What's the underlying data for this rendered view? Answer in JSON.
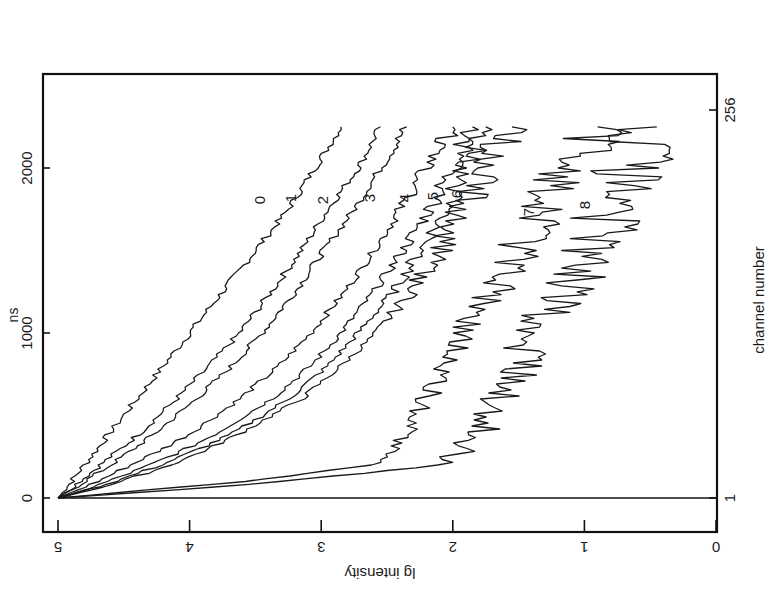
{
  "figure": {
    "orientation": "rotated 90 degrees clockwise (time axis vertical, intensity axis horizontal)",
    "x_axis_label": "lg intensity",
    "y_axis_left_label": "ns",
    "y_axis_right_label": "channel number",
    "x_ticks": [
      "5",
      "4",
      "3",
      "2",
      "1",
      "0"
    ],
    "y_left_ticks": [
      "0",
      "1000",
      "2000"
    ],
    "y_right_ticks": [
      "1",
      "256"
    ],
    "curve_labels": [
      "0",
      "1",
      "2",
      "3",
      "4",
      "5",
      "6",
      "7",
      "8"
    ]
  },
  "chart_data": {
    "type": "line",
    "title": "",
    "xlabel": "ns (channel number 1–256)",
    "ylabel": "lg Intensity",
    "xlim": [
      0,
      2250
    ],
    "ylim": [
      0,
      5
    ],
    "x_ticks": [
      0,
      1000,
      2000
    ],
    "y_ticks": [
      0,
      1,
      2,
      3,
      4,
      5
    ],
    "channel_ticks": [
      1,
      256
    ],
    "grid": false,
    "legend": "inline curve labels 0–8",
    "x": [
      0,
      50,
      100,
      200,
      300,
      400,
      600,
      800,
      1000,
      1250,
      1500,
      1750,
      2000,
      2250
    ],
    "series": [
      {
        "name": "0",
        "values": [
          5.0,
          4.95,
          4.9,
          4.8,
          4.7,
          4.6,
          4.4,
          4.2,
          4.0,
          3.75,
          3.5,
          3.25,
          3.05,
          2.85
        ]
      },
      {
        "name": "1",
        "values": [
          5.0,
          4.92,
          4.84,
          4.68,
          4.52,
          4.37,
          4.1,
          3.85,
          3.62,
          3.38,
          3.15,
          2.95,
          2.72,
          2.55
        ]
      },
      {
        "name": "2",
        "values": [
          5.0,
          4.9,
          4.8,
          4.6,
          4.42,
          4.25,
          3.95,
          3.68,
          3.45,
          3.2,
          2.98,
          2.75,
          2.55,
          2.35
        ]
      },
      {
        "name": "3",
        "values": [
          5.0,
          4.85,
          4.7,
          4.45,
          4.2,
          3.98,
          3.62,
          3.32,
          3.08,
          2.82,
          2.6,
          2.4,
          2.2,
          2.0
        ]
      },
      {
        "name": "4",
        "values": [
          5.0,
          4.8,
          4.62,
          4.3,
          4.02,
          3.78,
          3.38,
          3.08,
          2.85,
          2.6,
          2.38,
          2.18,
          2.0,
          1.85
        ]
      },
      {
        "name": "5",
        "values": [
          5.0,
          4.78,
          4.57,
          4.22,
          3.92,
          3.65,
          3.25,
          2.95,
          2.72,
          2.45,
          2.25,
          2.05,
          1.9,
          1.75
        ]
      },
      {
        "name": "6",
        "values": [
          5.0,
          4.75,
          4.52,
          4.15,
          3.85,
          3.6,
          3.15,
          2.85,
          2.58,
          2.32,
          2.1,
          1.92,
          1.75,
          1.55
        ]
      },
      {
        "name": "7",
        "values": [
          5.0,
          4.3,
          3.6,
          2.6,
          2.45,
          2.35,
          2.2,
          2.05,
          1.92,
          1.7,
          1.5,
          1.3,
          1.1,
          0.9
        ]
      },
      {
        "name": "8",
        "values": [
          5.0,
          4.1,
          3.3,
          2.1,
          1.9,
          1.8,
          1.65,
          1.5,
          1.35,
          1.15,
          0.95,
          0.8,
          0.65,
          0.45
        ]
      }
    ]
  }
}
